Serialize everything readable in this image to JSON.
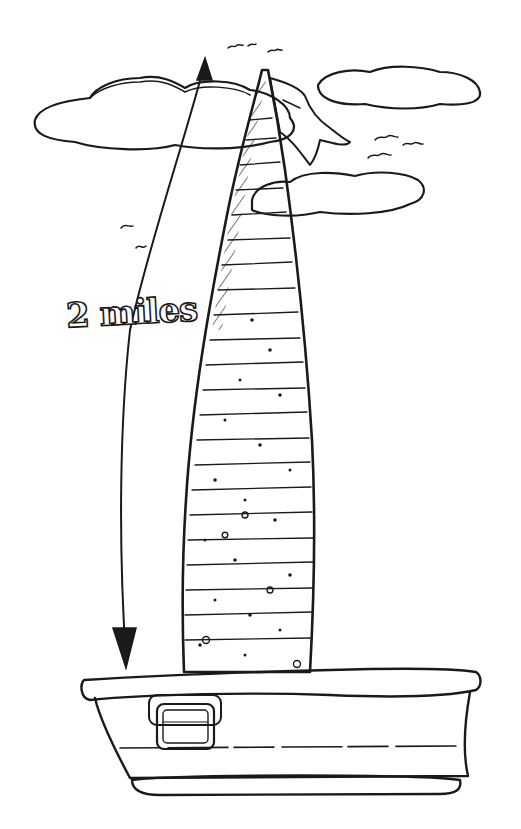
{
  "illustration": {
    "subject": "giant-carrot-in-tub",
    "measurement_label": "2 miles",
    "colors": {
      "ink": "#1a1a1a",
      "paper": "#ffffff"
    }
  }
}
